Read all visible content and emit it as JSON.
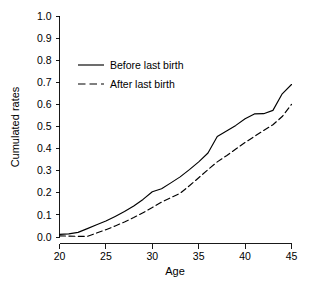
{
  "chart_data": {
    "type": "line",
    "title": "",
    "xlabel": "Age",
    "ylabel": "Cumulated rates",
    "xlim": [
      20,
      45
    ],
    "ylim": [
      0.0,
      1.0
    ],
    "grid": false,
    "legend_position": "upper-left-inside",
    "x_ticks": [
      20,
      25,
      30,
      35,
      40,
      45
    ],
    "x_tick_labels": [
      "20",
      "25",
      "30",
      "35",
      "40",
      "45"
    ],
    "y_ticks": [
      0.0,
      0.1,
      0.2,
      0.3,
      0.4,
      0.5,
      0.6,
      0.7,
      0.8,
      0.9,
      1.0
    ],
    "y_tick_labels": [
      "0.0",
      "0.1",
      "0.2",
      "0.3",
      "0.4",
      "0.5",
      "0.6",
      "0.7",
      "0.8",
      "0.9",
      "1.0"
    ],
    "x": [
      20,
      21,
      22,
      23,
      24,
      25,
      26,
      27,
      28,
      29,
      30,
      31,
      32,
      33,
      34,
      35,
      36,
      37,
      38,
      39,
      40,
      41,
      42,
      43,
      44,
      45
    ],
    "series": [
      {
        "name": "Before last birth",
        "style": "solid",
        "color": "#000000",
        "values": [
          0.012,
          0.014,
          0.021,
          0.038,
          0.055,
          0.072,
          0.093,
          0.115,
          0.14,
          0.17,
          0.205,
          0.218,
          0.245,
          0.272,
          0.305,
          0.34,
          0.38,
          0.455,
          0.48,
          0.505,
          0.535,
          0.557,
          0.558,
          0.573,
          0.648,
          0.69
        ]
      },
      {
        "name": "After last birth",
        "style": "dashed",
        "color": "#000000",
        "values": [
          0.005,
          0.004,
          0.003,
          0.003,
          0.018,
          0.033,
          0.05,
          0.068,
          0.088,
          0.11,
          0.133,
          0.158,
          0.178,
          0.198,
          0.232,
          0.268,
          0.305,
          0.34,
          0.368,
          0.398,
          0.428,
          0.455,
          0.482,
          0.508,
          0.545,
          0.6
        ]
      }
    ]
  },
  "legend": {
    "items": [
      {
        "label": "Before last birth",
        "style": "solid"
      },
      {
        "label": "After last birth",
        "style": "dashed"
      }
    ]
  }
}
